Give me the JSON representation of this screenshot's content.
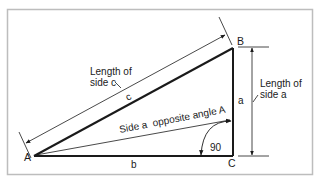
{
  "diagram": {
    "vertices": {
      "A": "A",
      "B": "B",
      "C": "C"
    },
    "sides": {
      "a": "a",
      "b": "b",
      "c": "c"
    },
    "labels": {
      "length_c_line1": "Length of",
      "length_c_line2": "side c",
      "length_a_line1": "Length of",
      "length_a_line2": "side a",
      "side_a_opposite": "Side a  opposite angle A",
      "right_angle": "90"
    },
    "colors": {
      "line": "#1a1a1a",
      "frame": "#bdbdbd",
      "background": "#ffffff"
    }
  }
}
